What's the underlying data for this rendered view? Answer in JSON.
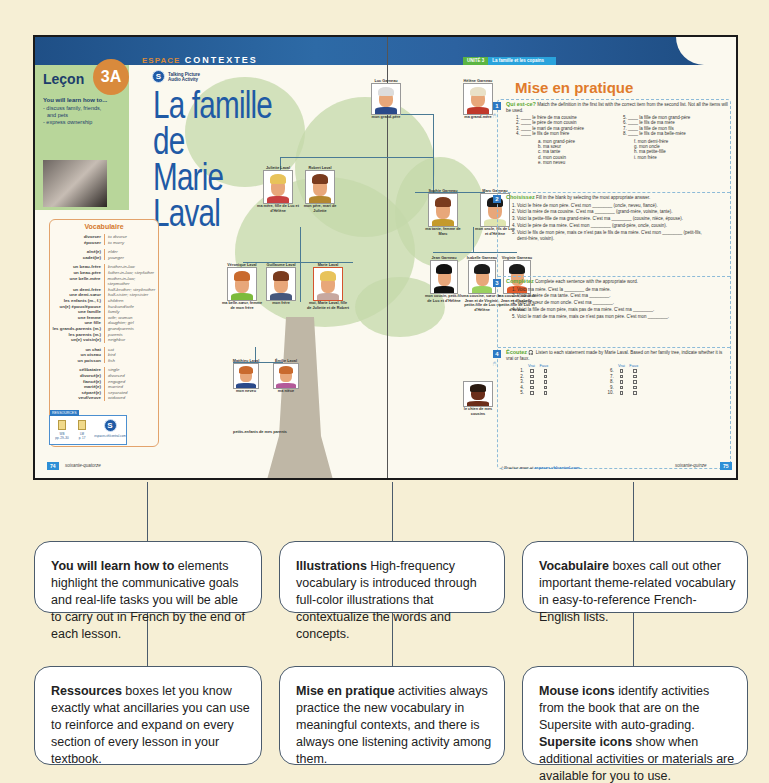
{
  "left_page": {
    "section_espace": "ESPACE",
    "section_name": "CONTEXTES",
    "lecon_label": "Leçon",
    "lecon_number": "3A",
    "learn_title": "You will learn how to...",
    "learn_items": [
      "- discuss family, friends,",
      "  and pets",
      "- express ownership"
    ],
    "talking_picture": [
      "Talking Picture",
      "Audio Activity"
    ],
    "title_line1": "La famille de",
    "title_line2": "Marie Laval",
    "page_number": "74",
    "page_word": "soixante-quatorze"
  },
  "vocabulaire": {
    "title": "Vocabulaire",
    "groups": [
      [
        [
          "divorcer",
          "to divorce"
        ],
        [
          "épouser",
          "to marry"
        ]
      ],
      [
        [
          "aîné(e)",
          "elder"
        ],
        [
          "cadet(te)",
          "younger"
        ]
      ],
      [
        [
          "un beau-frère",
          "brother-in-law"
        ],
        [
          "un beau-père",
          "father-in-law; stepfather"
        ],
        [
          "une belle-mère",
          "mother-in-law; stepmother"
        ],
        [
          "un demi-frère",
          "half-brother; stepbrother"
        ],
        [
          "une demi-sœur",
          "half-sister; stepsister"
        ],
        [
          "les enfants (m., f.)",
          "children"
        ],
        [
          "un(e) époux/épouse",
          "husband/wife"
        ],
        [
          "une famille",
          "family"
        ],
        [
          "une femme",
          "wife; woman"
        ],
        [
          "une fille",
          "daughter; girl"
        ],
        [
          "les grands-parents (m.)",
          "grandparents"
        ],
        [
          "les parents (m.)",
          "parents"
        ],
        [
          "un(e) voisin(e)",
          "neighbor"
        ]
      ],
      [
        [
          "un chat",
          "cat"
        ],
        [
          "un oiseau",
          "bird"
        ],
        [
          "un poisson",
          "fish"
        ]
      ],
      [
        [
          "célibataire",
          "single"
        ],
        [
          "divorcé(e)",
          "divorced"
        ],
        [
          "fiancé(e)",
          "engaged"
        ],
        [
          "marié(e)",
          "married"
        ],
        [
          "séparé(e)",
          "separated"
        ],
        [
          "veuf/veuve",
          "widowed"
        ]
      ]
    ]
  },
  "ressources": {
    "label": "RESSOURCES",
    "items": [
      {
        "name": "WB",
        "pages": "pp. 29–30"
      },
      {
        "name": "LM",
        "pages": "p. 17"
      }
    ],
    "supersite": "espaces.vhlcentral.com"
  },
  "family_tree": {
    "people": [
      {
        "name": "Luc Garneau",
        "caption": "mon grand-père"
      },
      {
        "name": "Hélène Garneau",
        "caption": "ma grand-mère"
      },
      {
        "name": "Juliette Laval",
        "caption": "ma mère, fille de Luc et d'Hélène"
      },
      {
        "name": "Robert Laval",
        "caption": "mon père, mari de Juliette"
      },
      {
        "name": "Sophie Garneau",
        "caption": "ma tante, femme de Marc"
      },
      {
        "name": "Marc Garneau",
        "caption": "mon oncle, fils de Luc et d'Hélène"
      },
      {
        "name": "Véronique Laval",
        "caption": "ma belle-sœur, femme de mon frère"
      },
      {
        "name": "Guillaume Laval",
        "caption": "mon frère"
      },
      {
        "name": "Marie Laval",
        "caption": "moi, Marie Laval, fille de Juliette et de Robert"
      },
      {
        "name": "Jean Garneau",
        "caption": "mon cousin, petit-fils de Luc et d'Hélène"
      },
      {
        "name": "Isabelle Garneau",
        "caption": "ma cousine, sœur de Jean et de Virginie, petite-fille de Luc et d'Hélène"
      },
      {
        "name": "Virginie Garneau",
        "caption": "ma cousine, sœur de Jean et d'Isabelle, petite-fille de Luc et d'Hélène"
      },
      {
        "name": "Matthieu Laval",
        "caption": "mon neveu"
      },
      {
        "name": "Émilie Laval",
        "caption": "ma nièce"
      },
      {
        "name": "Socrate",
        "caption": "le chien de mes cousins"
      }
    ],
    "grandchildren_caption": "petits-enfants de mes parents"
  },
  "right_page": {
    "unite_label": "UNITÉ 3",
    "unite_title": "La famille et les copains",
    "title": "Mise en pratique",
    "page_number": "75",
    "page_word": "soixante-quinze",
    "supersite_note_prefix": "Practice more at",
    "supersite_note_link": "espaces.vhlcentral.com.",
    "activities": [
      {
        "number": "1",
        "title": "Qui est-ce?",
        "instructions": "Match the definition in the first list with the correct item from the second list. Not all the items will be used.",
        "left_items": [
          "1. ____ le frère de ma cousine",
          "2. ____ le père de mon cousin",
          "3. ____ le mari de ma grand-mère",
          "4. ____ le fils de mon frère"
        ],
        "right_items": [
          "5. ____ la fille de mon grand-père",
          "6. ____ le fils de ma mère",
          "7. ____ la fille de mon fils",
          "8. ____ le fils de ma belle-mère"
        ],
        "options_left": [
          "a. mon grand-père",
          "b. ma sœur",
          "c. ma tante",
          "d. mon cousin",
          "e. mon neveu"
        ],
        "options_right": [
          "f. mon demi-frère",
          "g. mon oncle",
          "h. ma petite-fille",
          "i. mon frère"
        ]
      },
      {
        "number": "2",
        "title": "Choisissez",
        "instructions": "Fill in the blank by selecting the most appropriate answer.",
        "items": [
          "1. Voici le frère de mon père. C'est mon ________ (oncle, neveu, fiancé).",
          "2. Voici la mère de ma cousine. C'est ma ________ (grand-mère, voisine, tante).",
          "3. Voici la petite-fille de ma grand-mère. C'est ma ________ (cousine, nièce, épouse).",
          "4. Voici le père de ma mère. C'est mon ________ (grand-père, oncle, cousin).",
          "5. Voici le fils de mon père, mais ce n'est pas le fils de ma mère. C'est mon ________ (petit-fils, demi-frère, voisin)."
        ]
      },
      {
        "number": "3",
        "title": "Complétez",
        "instructions": "Complete each sentence with the appropriate word.",
        "items": [
          "1. Voici ma mère. C'est la ________ de ma mère.",
          "2. Voici la mère de ma tante. C'est ma ________.",
          "3. Voici la sœur de mon oncle. C'est ma ________.",
          "4. Voici la fille de mon père, mais pas de ma mère. C'est ma ________.",
          "5. Voici le mari de ma mère, mais ce n'est pas mon père. C'est mon ________."
        ]
      },
      {
        "number": "4",
        "title": "Écoutez",
        "instructions": "Listen to each statement made by Marie Laval. Based on her family tree, indicate whether it is vrai or faux.",
        "col_headers": [
          "Vrai",
          "Faux"
        ],
        "left_numbers": [
          "1.",
          "2.",
          "3.",
          "4.",
          "5."
        ],
        "right_numbers": [
          "6.",
          "7.",
          "8.",
          "9.",
          "10."
        ]
      }
    ]
  },
  "callouts": [
    {
      "lead": "You will learn how to",
      "text": " elements highlight the communicative goals and real-life tasks you will be able to carry out in French by the end of each lesson."
    },
    {
      "lead": "Illustrations",
      "text": " High-frequency vocabulary is introduced through full-color illustrations that contextualize the words and concepts."
    },
    {
      "lead": "Vocabulaire",
      "text": " boxes call out other important theme-related vocabulary in easy-to-reference French-English lists."
    },
    {
      "lead": "Ressources",
      "text": " boxes let you know exactly what ancillaries you can use to reinforce and expand on every section of every lesson in your textbook."
    },
    {
      "lead": "Mise en pratique",
      "text": " activities always practice the new vocabulary in meaningful contexts, and there is always one listening activity among them."
    },
    {
      "lead": "Mouse icons",
      "text": " identify activities from the book that are on the Supersite with auto-grading.",
      "lead2": "Supersite icons",
      "text2": " show when additional activities or materials are available for you to use."
    }
  ],
  "colors": {
    "background": "#f6efd5",
    "banner_blue": "#2d6aa6",
    "title_blue": "#1f5aa5",
    "accent_orange": "#e07b2c",
    "lesson_green": "#b8d69a",
    "callout_border": "#4b5b6c"
  }
}
